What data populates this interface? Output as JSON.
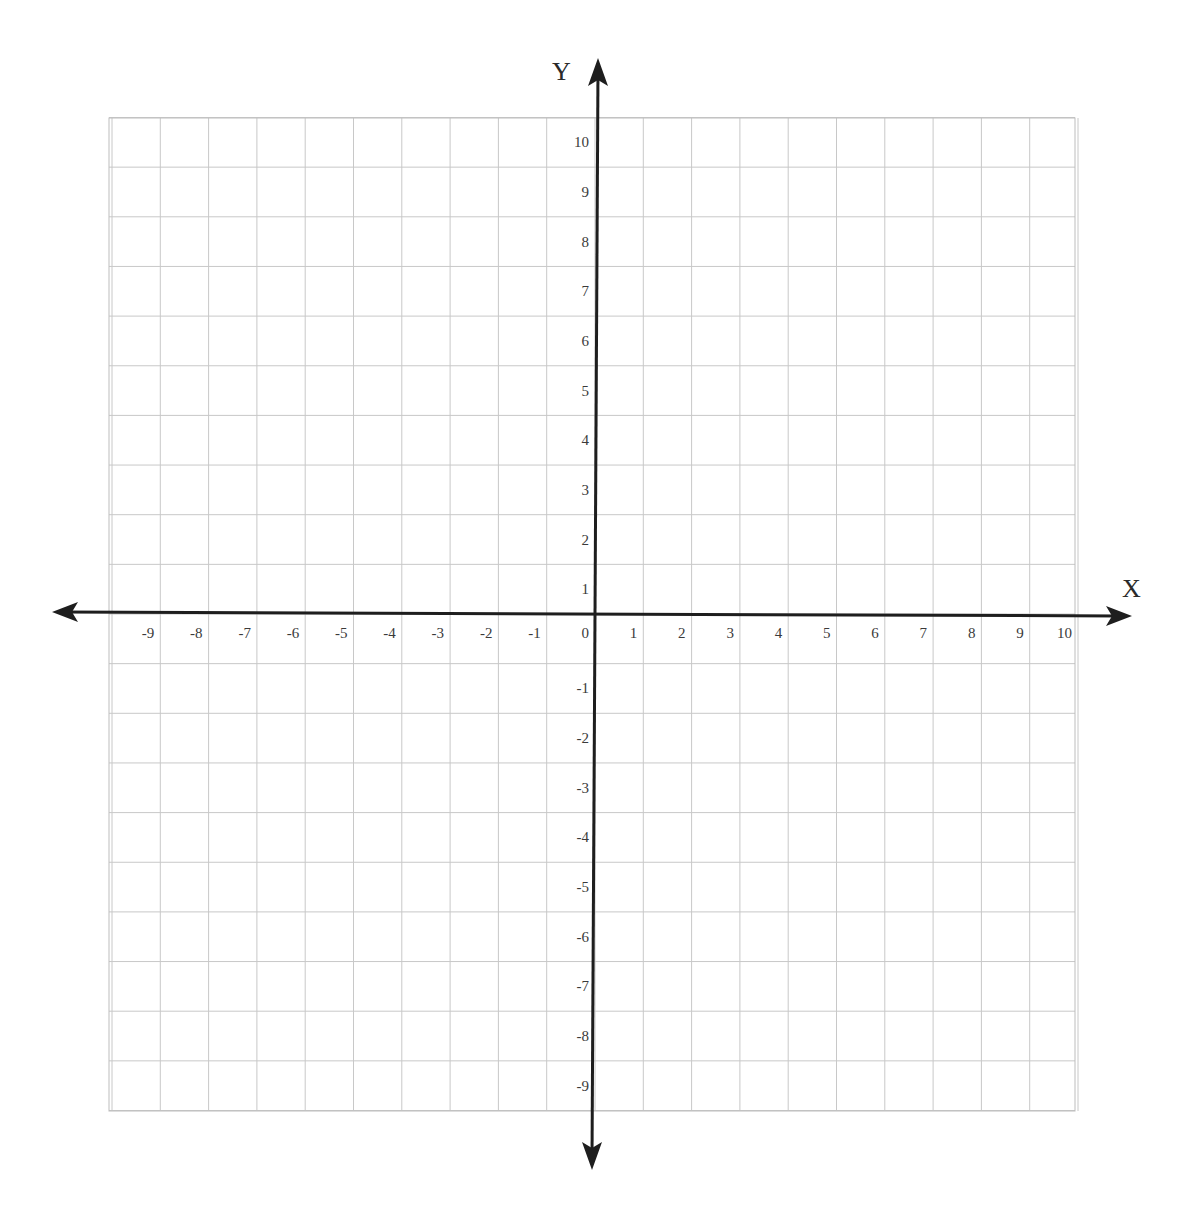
{
  "chart_data": {
    "type": "scatter",
    "title": "",
    "xlabel": "X",
    "ylabel": "Y",
    "xlim": [
      -10,
      10
    ],
    "ylim": [
      -10,
      10
    ],
    "grid": true,
    "x_tick_labels": [
      "-9",
      "-8",
      "-7",
      "-6",
      "-5",
      "-4",
      "-3",
      "-2",
      "-1",
      "0",
      "1",
      "2",
      "3",
      "4",
      "5",
      "6",
      "7",
      "8",
      "9",
      "10"
    ],
    "y_tick_labels": [
      "10",
      "9",
      "8",
      "7",
      "6",
      "5",
      "4",
      "3",
      "2",
      "1",
      "-1",
      "-2",
      "-3",
      "-4",
      "-5",
      "-6",
      "-7",
      "-8",
      "-9"
    ],
    "series": [],
    "legend": null
  },
  "colors": {
    "grid": "#c8c8c8",
    "axis": "#1e1e1e",
    "text": "#3a3a3a",
    "background": "#ffffff"
  }
}
